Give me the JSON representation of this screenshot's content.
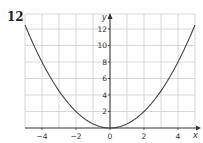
{
  "question_number": "12",
  "chart_data": {
    "type": "line",
    "title": "",
    "xlabel": "x",
    "ylabel": "y",
    "xlim": [
      -5,
      5
    ],
    "ylim": [
      0,
      14
    ],
    "grid": true,
    "x_ticks": [
      "-4",
      "-2",
      "0",
      "2",
      "4"
    ],
    "y_ticks": [
      "2",
      "4",
      "6",
      "8",
      "10",
      "12"
    ],
    "series": [
      {
        "name": "y = 0.5x^2",
        "equation": "y = x^2 / 2",
        "x": [
          -5,
          -4,
          -3,
          -2,
          -1,
          0,
          1,
          2,
          3,
          4,
          5
        ],
        "y": [
          12.5,
          8,
          4.5,
          2,
          0.5,
          0,
          0.5,
          2,
          4.5,
          8,
          12.5
        ],
        "color": "#444444"
      }
    ]
  }
}
